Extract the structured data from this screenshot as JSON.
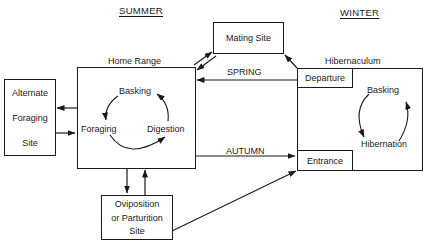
{
  "diagram": {
    "seasons": {
      "summer": "SUMMER",
      "winter": "WINTER"
    },
    "nodes": {
      "home_range": {
        "label": "Home Range",
        "cycle": [
          "Basking",
          "Digestion",
          "Foraging"
        ]
      },
      "mating_site": {
        "label": "Mating Site"
      },
      "alternate_foraging_site": {
        "lines": [
          "Alternate",
          "Foraging",
          "Site"
        ]
      },
      "oviposition_site": {
        "lines": [
          "Oviposition",
          "or Parturition",
          "Site"
        ]
      },
      "hibernaculum": {
        "label": "Hibernaculum",
        "departure": "Departure",
        "entrance": "Entrance",
        "cycle": [
          "Basking",
          "Hibernation"
        ]
      }
    },
    "edges": {
      "spring": "SPRING",
      "autumn": "AUTUMN"
    },
    "connections": [
      {
        "from": "Hibernaculum Departure",
        "to": "Home Range",
        "label": "SPRING"
      },
      {
        "from": "Home Range",
        "to": "Hibernaculum Entrance",
        "label": "AUTUMN"
      },
      {
        "from": "Home Range",
        "to": "Mating Site",
        "bidirectional": true
      },
      {
        "from": "Hibernaculum Departure",
        "to": "Mating Site"
      },
      {
        "from": "Home Range",
        "to": "Alternate Foraging Site",
        "bidirectional": true
      },
      {
        "from": "Home Range",
        "to": "Oviposition or Parturition Site",
        "bidirectional": true
      },
      {
        "from": "Oviposition or Parturition Site",
        "to": "Hibernaculum Entrance"
      }
    ],
    "colors": {
      "ink": "#1a1a1a",
      "background": "#ffffff"
    }
  }
}
